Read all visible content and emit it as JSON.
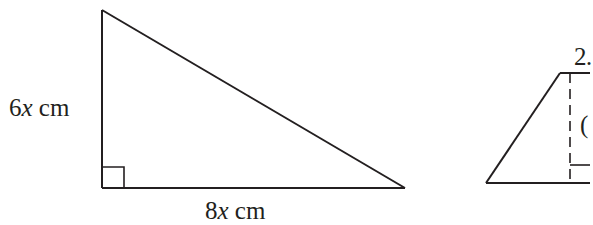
{
  "figure": {
    "triangle": {
      "height_label_num": "6",
      "height_label_var": "x",
      "height_label_unit": " cm",
      "base_label_num": "8",
      "base_label_var": "x",
      "base_label_unit": " cm",
      "right_angle": true
    },
    "trapezoid": {
      "top_label_partial": "2",
      "height_label_partial": "(",
      "right_angle": true,
      "cropped": true
    },
    "colors": {
      "stroke": "#231f20",
      "background": "#ffffff"
    }
  }
}
